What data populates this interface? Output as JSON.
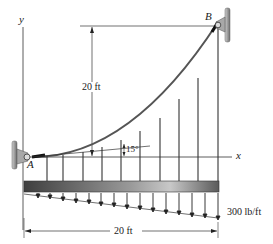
{
  "figure": {
    "type": "cable-supported-beam",
    "labels": {
      "y_axis": "y",
      "x_axis": "x",
      "point_a": "A",
      "point_b": "B",
      "height_dim": "20 ft",
      "span_dim": "20 ft",
      "angle": "15°",
      "load": "300 lb/ft"
    },
    "colors": {
      "line": "#333333",
      "beam_dark": "#4a4a4a",
      "beam_light": "#bdbdbd",
      "support": "#8a8a8a"
    },
    "hanger_count": 10,
    "load_arrow_count": 15
  }
}
